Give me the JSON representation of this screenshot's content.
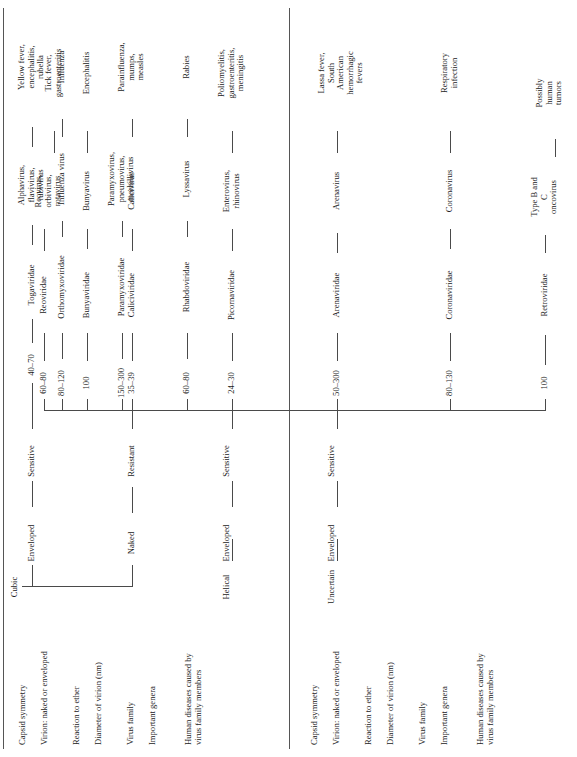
{
  "figure": {
    "type": "taxonomic-tree-table",
    "orientation": "rotated-90-ccw",
    "panel_count": 2
  },
  "row_labels": [
    "Capsid\nsymmetry",
    "Virion:\nnaked or\nenveloped",
    "Reaction to\nether",
    "Diameter of\nvirion\n(nm)",
    "Virus family",
    "Important\ngenera",
    "Human\ndiseases\ncaused by\nvirus\nfamily\nmembers"
  ],
  "panel1": {
    "capsid_symmetry": [
      "Cubic",
      "Helical"
    ],
    "branches": [
      {
        "capsid": "Cubic",
        "virion": "Naked",
        "ether": "Resistant",
        "leaves": [
          {
            "diameter": "24–30",
            "family": "Picornaviridae",
            "genera": "Enterovirus,\nrhinovirus",
            "diseases": "Poliomyelitis,\ngastroenteritis,\nmeningitis"
          },
          {
            "diameter": "35–39",
            "family": "Caliciviridae",
            "genera": "Calicivirus",
            "diseases": ""
          },
          {
            "diameter": "60–80",
            "family": "Reoviridae",
            "genera": "Reovirus,\norbivirus,\nrotavirus",
            "diseases": "Tick fever,\ngastroenteritis"
          }
        ]
      },
      {
        "capsid": "Cubic",
        "virion": "Enveloped",
        "ether": "Sensitive",
        "leaves": [
          {
            "diameter": "40–70",
            "family": "Togaviridae",
            "genera": "Alphavirus,\nflavivirus,\nrubivirus",
            "diseases": "Yellow fever,\nencephalitis,\nrubella"
          }
        ]
      },
      {
        "capsid": "Helical",
        "virion": "Enveloped",
        "ether": "Sensitive",
        "leaves": [
          {
            "diameter": "80–120",
            "family": "Orthomyxoviridae",
            "genera": "Influenza virus",
            "diseases": "Influenza"
          },
          {
            "diameter": "150–300",
            "family": "Paramyxoviridae",
            "genera": "Paramyxovirus,\npneumovirus,\nmorbillivirus",
            "diseases": "Parainfluenza,\nmumps,\nmeasles"
          },
          {
            "diameter": "60–80",
            "family": "Rhabdoviridae",
            "genera": "Lyssavirus",
            "diseases": "Rabies"
          }
        ]
      }
    ]
  },
  "panel2": {
    "capsid_symmetry": [
      "Uncertain"
    ],
    "branches": [
      {
        "capsid": "Uncertain",
        "virion": "Enveloped",
        "ether": "Sensitive",
        "leaves": [
          {
            "diameter": "100",
            "family": "Retroviridae",
            "genera": "Type B and\nC\noncovirus",
            "diseases": "Possibly\nhuman\ntumors"
          },
          {
            "diameter": "50–300",
            "family": "Arenaviridae",
            "genera": "Arenavirus",
            "diseases": "Lassa fever,\nSouth\nAmerican\nhemorrhagic\nfevers"
          },
          {
            "diameter": "80–130",
            "family": "Coronaviridae",
            "genera": "Coronavirus",
            "diseases": "Respiratory\ninfection"
          },
          {
            "diameter": "100",
            "family": "Bunyaviridae",
            "genera": "Bunyavirus",
            "diseases": "Encephalitis"
          }
        ]
      }
    ]
  }
}
